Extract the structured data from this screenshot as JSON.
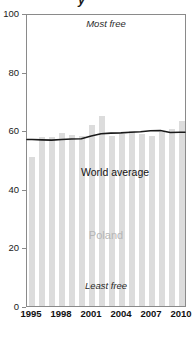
{
  "chart_data": {
    "type": "bar",
    "title": "",
    "subtitle": "",
    "xlabel": "",
    "ylabel": "",
    "ylim": [
      0,
      100
    ],
    "grid": false,
    "legend_position": "inline-annotation",
    "categories": [
      "1995",
      "1996",
      "1997",
      "1998",
      "1999",
      "2000",
      "2001",
      "2002",
      "2003",
      "2004",
      "2005",
      "2006",
      "2007",
      "2008",
      "2009",
      "2010"
    ],
    "x_tick_labels": [
      "1995",
      "1998",
      "2001",
      "2004",
      "2007",
      "2010"
    ],
    "y_tick_labels": [
      "0",
      "20",
      "40",
      "60",
      "80",
      "100"
    ],
    "y_ticks": [
      0,
      20,
      40,
      60,
      80,
      100
    ],
    "series": [
      {
        "name": "Poland",
        "type": "bar",
        "color": "#dcdcdc",
        "values": [
          50.7,
          57.8,
          57.8,
          58.9,
          58.5,
          58.0,
          61.8,
          65.0,
          58.1,
          58.7,
          59.6,
          58.8,
          58.1,
          59.5,
          60.3,
          63.2
        ]
      },
      {
        "name": "World average",
        "type": "line",
        "color": "#1a1a1a",
        "values": [
          57.2,
          57.1,
          57.0,
          57.2,
          57.4,
          57.5,
          58.4,
          59.2,
          59.4,
          59.5,
          59.7,
          59.9,
          60.2,
          60.3,
          59.6,
          59.7
        ]
      }
    ],
    "annotations": [
      {
        "name": "most-free",
        "text": "Most free",
        "position": "top-center",
        "style": "italic"
      },
      {
        "name": "least-free",
        "text": "Least free",
        "position": "bottom-center",
        "style": "italic"
      },
      {
        "name": "poland-label",
        "text": "Poland",
        "position": "center",
        "color": "#b5b5b5"
      },
      {
        "name": "world-average-label",
        "text": "World average",
        "position": "upper-center",
        "color": "#141414"
      }
    ]
  },
  "annotations": {
    "most_free": "Most free",
    "least_free": "Least free",
    "poland": "Poland",
    "world_average": "World average"
  },
  "axes": {
    "y_labels": [
      "100",
      "80",
      "60",
      "40",
      "20",
      "0"
    ],
    "x_labels": [
      "1995",
      "1998",
      "2001",
      "2004",
      "2007",
      "2010"
    ]
  },
  "colors": {
    "bar": "#dcdcdc",
    "line": "#1a1a1a",
    "frame": "#8a8a8a",
    "poland_label": "#b5b5b5"
  },
  "top_fragment": "y"
}
